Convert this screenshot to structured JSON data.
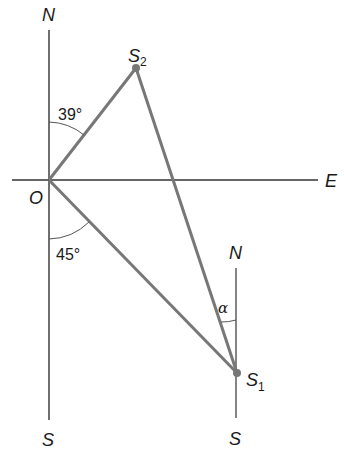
{
  "diagram": {
    "type": "bearing-triangle",
    "colors": {
      "axis": "#333333",
      "segment": "#777777",
      "point": "#777777",
      "arc": "#555555",
      "text": "#1a1a1a"
    },
    "labels": {
      "north_main": "N",
      "south_main": "S",
      "east": "E",
      "origin": "O",
      "s2_main": "S",
      "s2_sub": "2",
      "s1_main": "S",
      "s1_sub": "1",
      "north_s1": "N",
      "south_s1": "S",
      "angle_north": "39°",
      "angle_south": "45°",
      "angle_alpha": "α"
    },
    "points": {
      "O": {
        "x": 49,
        "y": 180
      },
      "S2": {
        "x": 136,
        "y": 68
      },
      "S1": {
        "x": 237,
        "y": 373
      }
    },
    "angles": {
      "bearing_S2_from_north": 39,
      "angle_S1_from_south": 45,
      "alpha": "α"
    }
  }
}
